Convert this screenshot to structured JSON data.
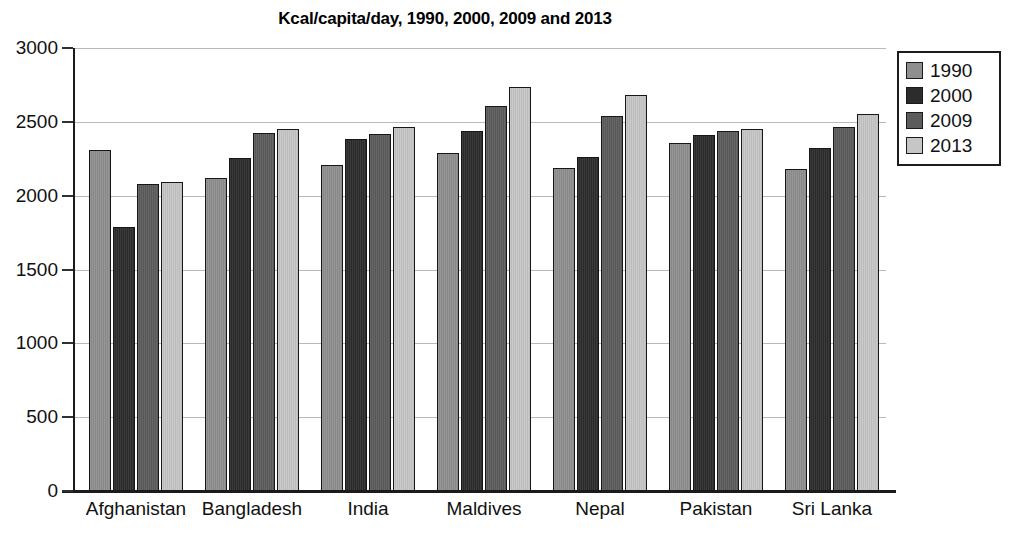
{
  "chart_data": {
    "type": "bar",
    "title": "Kcal/capita/day, 1990, 2000, 2009 and 2013",
    "xlabel": "",
    "ylabel": "",
    "ylim": [
      0,
      3000
    ],
    "yticks": [
      0,
      500,
      1000,
      1500,
      2000,
      2500,
      3000
    ],
    "ytick_labels": [
      "0",
      "500",
      "1000",
      "1500",
      "2000",
      "2500",
      "3000"
    ],
    "grid": true,
    "legend_position": "upper right",
    "categories": [
      "Afghanistan",
      "Bangladesh",
      "India",
      "Maldives",
      "Nepal",
      "Pakistan",
      "Sri Lanka"
    ],
    "series": [
      {
        "name": "1990",
        "color": "#8f8f8f",
        "values": [
          2310,
          2120,
          2210,
          2290,
          2190,
          2355,
          2180
        ]
      },
      {
        "name": "2000",
        "color": "#2c2c2c",
        "values": [
          1790,
          2255,
          2385,
          2440,
          2265,
          2410,
          2325
        ]
      },
      {
        "name": "2009",
        "color": "#5c5c5c",
        "values": [
          2080,
          2425,
          2415,
          2610,
          2540,
          2440,
          2465
        ]
      },
      {
        "name": "2013",
        "color": "#c6c6c6",
        "values": [
          2090,
          2450,
          2465,
          2735,
          2685,
          2450,
          2555
        ]
      }
    ]
  },
  "legend": {
    "entries": [
      "1990",
      "2000",
      "2009",
      "2013"
    ]
  }
}
